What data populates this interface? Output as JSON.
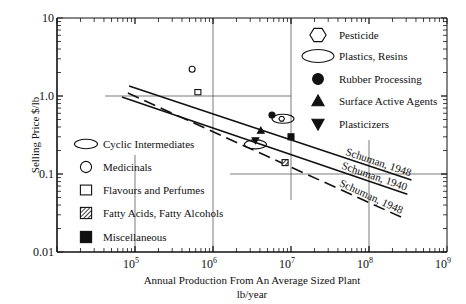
{
  "chart_data": {
    "type": "line",
    "title": "",
    "xlabel": "Annual Production From An Average Sized Plant",
    "xlabel_units": "lb/year",
    "ylabel": "Selling Price $/lb",
    "xscale": "log",
    "yscale": "log",
    "xlim": [
      10000,
      1000000000
    ],
    "ylim": [
      0.01,
      10
    ],
    "x_ticks": [
      {
        "value": 100000,
        "base": "10",
        "exp": "5"
      },
      {
        "value": 1000000,
        "base": "10",
        "exp": "6"
      },
      {
        "value": 10000000,
        "base": "10",
        "exp": "7"
      },
      {
        "value": 100000000,
        "base": "10",
        "exp": "8"
      },
      {
        "value": 1000000000,
        "base": "10",
        "exp": "9"
      }
    ],
    "y_ticks": [
      {
        "value": 10,
        "label": "10"
      },
      {
        "value": 1,
        "label": "1.0"
      },
      {
        "value": 0.1,
        "label": "0.1"
      },
      {
        "value": 0.01,
        "label": "0.01"
      }
    ],
    "grid": "partial",
    "series": [
      {
        "name": "Schuman, 1948",
        "style": "solid",
        "x": [
          84000,
          350000000
        ],
        "y": [
          1.34,
          0.084
        ]
      },
      {
        "name": "Schuman, 1940",
        "style": "solid",
        "x": [
          68000,
          310000000
        ],
        "y": [
          0.97,
          0.055
        ]
      },
      {
        "name": "Schuman, 1948",
        "style": "dashed",
        "x": [
          81000,
          280000000
        ],
        "y": [
          1.09,
          0.027
        ]
      }
    ],
    "points": [
      {
        "category": "Medicinals",
        "symbol": "open-circle",
        "x": 540000,
        "y": 2.2
      },
      {
        "category": "Flavours and Perfumes",
        "symbol": "open-square",
        "x": 640000,
        "y": 1.12
      },
      {
        "category": "Rubber Processing",
        "symbol": "filled-circle",
        "x": 5700000,
        "y": 0.57
      },
      {
        "category": "Plastics, Resins",
        "symbol": "open-ellipse",
        "x": 7900000,
        "y": 0.51
      },
      {
        "category": "Pesticide",
        "symbol": "hexagon",
        "x": 7600000,
        "y": 0.51
      },
      {
        "category": "Surface Active Agents",
        "symbol": "filled-triangle-up",
        "x": 4100000,
        "y": 0.36
      },
      {
        "category": "Miscellaneous",
        "symbol": "filled-square",
        "x": 10000000,
        "y": 0.3
      },
      {
        "category": "Plasticizers",
        "symbol": "filled-triangle-down",
        "x": 3500000,
        "y": 0.27
      },
      {
        "category": "Cyclic Intermediates",
        "symbol": "open-ellipse",
        "x": 3500000,
        "y": 0.24
      },
      {
        "category": "Fatty Acids, Fatty Alcohols",
        "symbol": "hatched-square",
        "x": 8400000,
        "y": 0.14
      }
    ],
    "legend_right": [
      {
        "symbol": "hexagon",
        "label": "Pesticide"
      },
      {
        "symbol": "open-ellipse",
        "label": "Plastics, Resins"
      },
      {
        "symbol": "filled-circle",
        "label": "Rubber Processing"
      },
      {
        "symbol": "filled-triangle-up",
        "label": "Surface Active Agents"
      },
      {
        "symbol": "filled-triangle-down",
        "label": "Plasticizers"
      }
    ],
    "legend_left": [
      {
        "symbol": "open-ellipse",
        "label": "Cyclic Intermediates"
      },
      {
        "symbol": "open-circle",
        "label": "Medicinals"
      },
      {
        "symbol": "open-square",
        "label": "Flavours and Perfumes"
      },
      {
        "symbol": "hatched-square",
        "label": "Fatty Acids, Fatty Alcohols"
      },
      {
        "symbol": "filled-square",
        "label": "Miscellaneous"
      }
    ]
  }
}
